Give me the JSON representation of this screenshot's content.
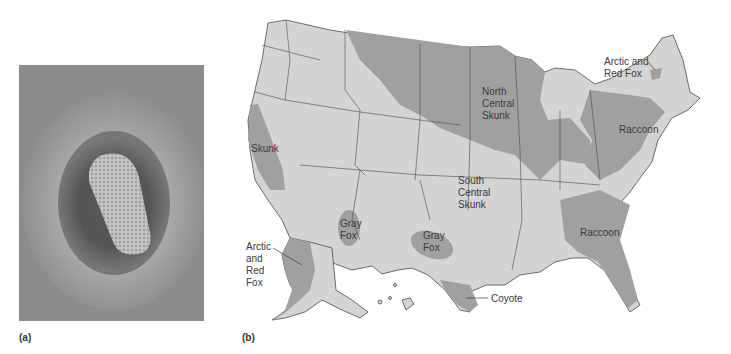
{
  "figure": {
    "panels": [
      {
        "id": "a",
        "label": "(a)",
        "type": "micrograph",
        "description": "Electron micrograph of bullet-shaped virion"
      },
      {
        "id": "b",
        "label": "(b)",
        "type": "map",
        "description": "US distribution of reservoir animals"
      }
    ]
  },
  "colors": {
    "background": "#ffffff",
    "land_light": "#d4d4d4",
    "reservoir_dark": "#a0a0a0",
    "border": "#4a4a4a",
    "label_text": "#3a3a3a"
  },
  "map": {
    "regions": [
      {
        "name": "Skunk",
        "label_lines": [
          "Skunk"
        ]
      },
      {
        "name": "North Central Skunk",
        "label_lines": [
          "North",
          "Central",
          "Skunk"
        ]
      },
      {
        "name": "South Central Skunk",
        "label_lines": [
          "South",
          "Central",
          "Skunk"
        ]
      },
      {
        "name": "Gray Fox (Arizona)",
        "label_lines": [
          "Gray",
          "Fox"
        ]
      },
      {
        "name": "Gray Fox (Texas)",
        "label_lines": [
          "Gray",
          "Fox"
        ]
      },
      {
        "name": "Coyote",
        "label_lines": [
          "Coyote"
        ]
      },
      {
        "name": "Raccoon (Northeast)",
        "label_lines": [
          "Raccoon"
        ]
      },
      {
        "name": "Raccoon (Southeast)",
        "label_lines": [
          "Raccoon"
        ]
      },
      {
        "name": "Arctic and Red Fox (Northeast)",
        "label_lines": [
          "Arctic and",
          "Red Fox"
        ]
      },
      {
        "name": "Arctic and Red Fox (Alaska)",
        "label_lines": [
          "Arctic",
          "and",
          "Red",
          "Fox"
        ]
      }
    ]
  }
}
